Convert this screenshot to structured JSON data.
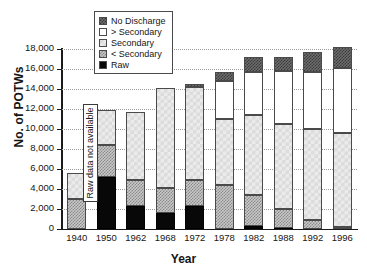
{
  "chart_data": {
    "type": "bar",
    "subtype": "stacked-bar",
    "title": "",
    "xlabel": "Year",
    "ylabel": "No. of POTWs",
    "categories": [
      "1940",
      "1950",
      "1962",
      "1968",
      "1972",
      "1978",
      "1982",
      "1988",
      "1992",
      "1996"
    ],
    "ylim": [
      0,
      18000
    ],
    "ytick_values": [
      0,
      2000,
      4000,
      6000,
      8000,
      10000,
      12000,
      14000,
      16000,
      18000
    ],
    "ytick_labels": [
      "0",
      "2,000",
      "4,000",
      "6,000",
      "8,000",
      "10,000",
      "12,000",
      "14,000",
      "16,000",
      "18,000"
    ],
    "grid": true,
    "grid_style": "dotted-horizontal",
    "legend_position": "top-center-inside",
    "stack_order_bottom_to_top": [
      "Raw",
      "< Secondary",
      "Secondary",
      "> Secondary",
      "No Discharge"
    ],
    "series": [
      {
        "name": "Raw",
        "color": "#080808",
        "pattern": "solid-black",
        "values": [
          0,
          5200,
          2300,
          1600,
          2350,
          0,
          280,
          120,
          0,
          0
        ]
      },
      {
        "name": "< Secondary",
        "color": "#c8c8c8",
        "pattern": "checkerboard-medium",
        "values": [
          3000,
          3200,
          2650,
          2500,
          2600,
          4450,
          3150,
          1900,
          950,
          200
        ]
      },
      {
        "name": "Secondary",
        "color": "#dcdcdc",
        "pattern": "diagonal-light",
        "values": [
          2600,
          3500,
          6750,
          10000,
          9300,
          6600,
          8000,
          8500,
          9100,
          9450
        ]
      },
      {
        "name": "> Secondary",
        "color": "#ffffff",
        "pattern": "white",
        "values": [
          0,
          0,
          0,
          0,
          0,
          3800,
          4300,
          5300,
          5700,
          6500
        ]
      },
      {
        "name": "No Discharge",
        "color": "#6e6e6e",
        "pattern": "crosshatch-dark",
        "values": [
          0,
          0,
          0,
          0,
          250,
          850,
          1450,
          1400,
          1950,
          2050
        ]
      }
    ],
    "totals": [
      5600,
      11900,
      11700,
      14100,
      14500,
      15700,
      17180,
      17220,
      17700,
      18200
    ],
    "annotations": [
      {
        "text": "Raw data not available",
        "category": "1940",
        "orientation": "vertical",
        "boxed": true
      }
    ]
  },
  "legend": {
    "items": [
      {
        "label": "No Discharge",
        "swatch": "crosshatch-dark"
      },
      {
        "label": "> Secondary",
        "swatch": "white"
      },
      {
        "label": "Secondary",
        "swatch": "diagonal-light"
      },
      {
        "label": "< Secondary",
        "swatch": "checkerboard-medium"
      },
      {
        "label": "Raw",
        "swatch": "solid-black"
      }
    ]
  },
  "annotation": {
    "no_data_text": "Raw data not available"
  }
}
